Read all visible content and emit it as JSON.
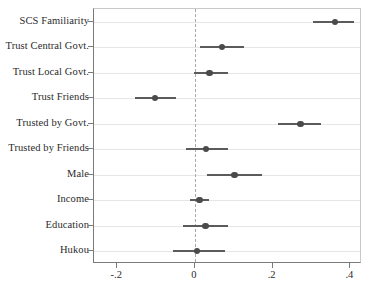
{
  "chart_data": {
    "type": "scatter",
    "title": "",
    "subtitle": "",
    "xlabel": "",
    "ylabel": "",
    "xlim": [
      -0.26,
      0.43
    ],
    "xticks": [
      -0.2,
      0,
      0.2,
      0.4
    ],
    "xticklabels": [
      "-.2",
      "0",
      ".2",
      ".4"
    ],
    "grid": true,
    "legend": null,
    "reference_line": 0,
    "reference_line_style": "dashed",
    "orientation": "horizontal",
    "marker": "filled-circle",
    "error_bars": "confidence-interval",
    "categories": [
      "SCS Familiarity",
      "Trust Central Govt.",
      "Trust Local Govt.",
      "Trust Friends",
      "Trusted by Govt.",
      "Trusted by Friends",
      "Male",
      "Income",
      "Education",
      "Hukou"
    ],
    "points": [
      {
        "label": "SCS Familiarity",
        "estimate": 0.36,
        "ci_low": 0.305,
        "ci_high": 0.41
      },
      {
        "label": "Trust Central Govt.",
        "estimate": 0.07,
        "ci_low": 0.013,
        "ci_high": 0.125
      },
      {
        "label": "Trust Local Govt.",
        "estimate": 0.037,
        "ci_low": -0.003,
        "ci_high": 0.085
      },
      {
        "label": "Trust Friends",
        "estimate": -0.103,
        "ci_low": -0.155,
        "ci_high": -0.048
      },
      {
        "label": "Trusted by Govt.",
        "estimate": 0.272,
        "ci_low": 0.215,
        "ci_high": 0.325
      },
      {
        "label": "Trusted by Friends",
        "estimate": 0.028,
        "ci_low": -0.022,
        "ci_high": 0.085
      },
      {
        "label": "Male",
        "estimate": 0.102,
        "ci_low": 0.03,
        "ci_high": 0.173
      },
      {
        "label": "Income",
        "estimate": 0.012,
        "ci_low": -0.012,
        "ci_high": 0.037
      },
      {
        "label": "Education",
        "estimate": 0.027,
        "ci_low": -0.032,
        "ci_high": 0.085
      },
      {
        "label": "Hukou",
        "estimate": 0.005,
        "ci_low": -0.057,
        "ci_high": 0.077
      }
    ],
    "colors": {
      "marker": "#4a4a4a",
      "error_bar": "#5b5b5b",
      "grid": "#e6e6e6",
      "axis": "#7a7a7a",
      "reference_line": "#b0a89c",
      "background": "#ffffff",
      "text": "#2b2b2b"
    }
  }
}
